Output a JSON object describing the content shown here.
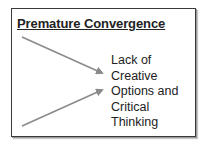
{
  "diagram": {
    "title": "Premature Convergence",
    "result_label": "Lack of Creative Options and Critical Thinking",
    "arrow_color": "#8a8a8a",
    "arrows": [
      {
        "from": [
          22,
          37
        ],
        "to": [
          104,
          74
        ]
      },
      {
        "from": [
          22,
          126
        ],
        "to": [
          104,
          89
        ]
      }
    ]
  }
}
